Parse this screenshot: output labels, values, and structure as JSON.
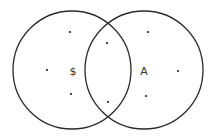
{
  "diagram": {
    "type": "venn",
    "stroke_color": "#2b2b2b",
    "dot_color": "#222222",
    "sets": [
      {
        "id": "left",
        "label": "$",
        "cx": 72,
        "cy": 70,
        "r": 59
      },
      {
        "id": "right",
        "label": "A",
        "cx": 144,
        "cy": 70,
        "r": 59
      }
    ],
    "labels": [
      {
        "text": "$",
        "x": 73,
        "y": 75
      },
      {
        "text": "A",
        "x": 144,
        "y": 75
      }
    ],
    "points": [
      {
        "region": "left-only",
        "x": 70,
        "y": 32
      },
      {
        "region": "left-only",
        "x": 47,
        "y": 70
      },
      {
        "region": "left-only",
        "x": 71,
        "y": 94
      },
      {
        "region": "intersection",
        "x": 107,
        "y": 43
      },
      {
        "region": "intersection",
        "x": 108,
        "y": 102
      },
      {
        "region": "right-only",
        "x": 148,
        "y": 32
      },
      {
        "region": "right-only",
        "x": 178,
        "y": 71
      },
      {
        "region": "right-only",
        "x": 146,
        "y": 96
      }
    ]
  }
}
